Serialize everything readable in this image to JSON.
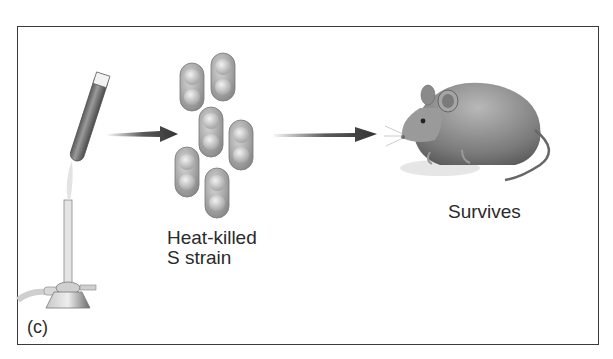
{
  "figure": {
    "panel_label": "(c)",
    "steps": [
      {
        "id": "burner",
        "description": "Test tube heated over Bunsen burner"
      },
      {
        "id": "bacteria",
        "caption_line1": "Heat-killed",
        "caption_line2": "S strain"
      },
      {
        "id": "mouse",
        "caption": "Survives"
      }
    ],
    "arrows": 2,
    "colors": {
      "frame": "#3a3a3a",
      "arrow": "#3d3d3d",
      "text": "#2a2a2a",
      "bacteria_fill": "#9a9a9a",
      "mouse_fill": "#8a8a8a"
    }
  }
}
